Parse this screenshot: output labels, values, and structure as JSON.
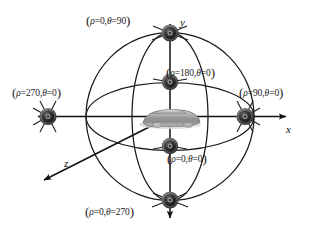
{
  "figure": {
    "type": "diagram",
    "background_color": "#ffffff",
    "line_color": "#1a1a1a",
    "speaker_color": "#2b2b2b"
  },
  "axes": [
    {
      "id": "y-axis",
      "label": "y",
      "direction": "up"
    },
    {
      "id": "x-axis",
      "label": "x",
      "direction": "right"
    },
    {
      "id": "z-axis",
      "label": "z",
      "direction": "down-left"
    }
  ],
  "center_object": {
    "name": "car",
    "description": "grayscale automobile at origin"
  },
  "speakers": [
    {
      "id": "speaker-top",
      "rho": "0",
      "theta": "90",
      "label": "(ρ=0,θ=90)"
    },
    {
      "id": "speaker-inner-upper",
      "rho": "180",
      "theta": "0",
      "label": "(ρ=180,θ=0)"
    },
    {
      "id": "speaker-left",
      "rho": "270",
      "theta": "0",
      "label": "(ρ=270,θ=0)"
    },
    {
      "id": "speaker-right",
      "rho": "90",
      "theta": "0",
      "label": "(ρ=90,θ=0)"
    },
    {
      "id": "speaker-inner-lower",
      "rho": "0",
      "theta": "0",
      "label": "(ρ=0,θ=0)"
    },
    {
      "id": "speaker-bottom",
      "rho": "0",
      "theta": "270",
      "label": "(ρ=0,θ=270)"
    }
  ],
  "labels": {
    "top": {
      "open": "(",
      "rho_sym": "ρ",
      "rho_eq": "=0,",
      "theta_sym": "θ",
      "theta_eq": "=90",
      "close": ")"
    },
    "inner_upper": {
      "open": "(",
      "rho_sym": "ρ",
      "rho_eq": "=180,",
      "theta_sym": "θ",
      "theta_eq": "=0",
      "close": ")"
    },
    "left": {
      "open": "(",
      "rho_sym": "ρ",
      "rho_eq": "=270,",
      "theta_sym": "θ",
      "theta_eq": "=0",
      "close": ")"
    },
    "right": {
      "open": "(",
      "rho_sym": "ρ",
      "rho_eq": "=90,",
      "theta_sym": "θ",
      "theta_eq": "=0",
      "close": ")"
    },
    "inner_lower": {
      "open": "(",
      "rho_sym": "ρ",
      "rho_eq": "=0,",
      "theta_sym": "θ",
      "theta_eq": "=0",
      "close": ")"
    },
    "bottom": {
      "open": "(",
      "rho_sym": "ρ",
      "rho_eq": "=0,",
      "theta_sym": "θ",
      "theta_eq": "=270",
      "close": ")"
    }
  },
  "axis_text": {
    "y": "y",
    "x": "x",
    "z": "z"
  }
}
